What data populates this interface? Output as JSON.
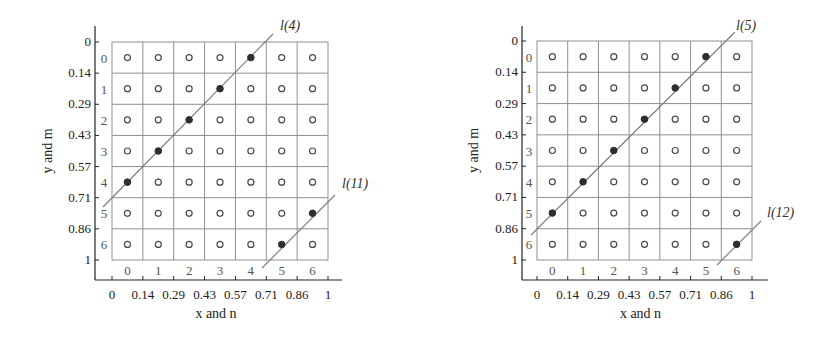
{
  "chart_data": [
    {
      "type": "scatter",
      "panel": "left",
      "xlabel": "x and n",
      "ylabel": "y and m",
      "x_ticks": [
        "0",
        "0.14",
        "0.29",
        "0.43",
        "0.57",
        "0.71",
        "0.86",
        "1"
      ],
      "y_ticks": [
        "0",
        "0.14",
        "0.29",
        "0.43",
        "0.57",
        "0.71",
        "0.86",
        "1"
      ],
      "column_indices": [
        "0",
        "1",
        "2",
        "3",
        "4",
        "5",
        "6"
      ],
      "row_indices": [
        "0",
        "1",
        "2",
        "3",
        "4",
        "5",
        "6"
      ],
      "grid_size": 7,
      "xlim": [
        0,
        1
      ],
      "ylim": [
        1,
        0
      ],
      "lines": [
        {
          "label": "l(4)",
          "filled_points": [
            [
              4,
              0
            ],
            [
              3,
              1
            ],
            [
              2,
              2
            ],
            [
              1,
              3
            ],
            [
              0,
              4
            ]
          ]
        },
        {
          "label": "l(11)",
          "filled_points": [
            [
              6,
              5
            ],
            [
              5,
              6
            ]
          ]
        }
      ],
      "note": "points given as [n, m]; all other grid cells hold open circles"
    },
    {
      "type": "scatter",
      "panel": "right",
      "xlabel": "x and n",
      "ylabel": "y and m",
      "x_ticks": [
        "0",
        "0.14",
        "0.29",
        "0.43",
        "0.57",
        "0.71",
        "0.86",
        "1"
      ],
      "y_ticks": [
        "0",
        "0.14",
        "0.29",
        "0.43",
        "0.57",
        "0.71",
        "0.86",
        "1"
      ],
      "column_indices": [
        "0",
        "1",
        "2",
        "3",
        "4",
        "5",
        "6"
      ],
      "row_indices": [
        "0",
        "1",
        "2",
        "3",
        "4",
        "5",
        "6"
      ],
      "grid_size": 7,
      "xlim": [
        0,
        1
      ],
      "ylim": [
        1,
        0
      ],
      "lines": [
        {
          "label": "l(5)",
          "filled_points": [
            [
              5,
              0
            ],
            [
              4,
              1
            ],
            [
              3,
              2
            ],
            [
              2,
              3
            ],
            [
              1,
              4
            ],
            [
              0,
              5
            ]
          ]
        },
        {
          "label": "l(12)",
          "filled_points": [
            [
              6,
              6
            ]
          ]
        }
      ],
      "note": "points given as [n, m]; all other grid cells hold open circles"
    }
  ],
  "panels": {
    "left": {
      "xlabel": "x and n",
      "ylabel": "y and m",
      "line_a_label": "l(4)",
      "line_b_label": "l(11)"
    },
    "right": {
      "xlabel": "x and n",
      "ylabel": "y and m",
      "line_a_label": "l(5)",
      "line_b_label": "l(12)"
    }
  },
  "colors": {
    "grid": "#8f8f8f",
    "axis": "#222222",
    "diagonal": "#7a7a7a",
    "filled_dot": "#2e2e2e",
    "open_dot_stroke": "#4a4a4a"
  }
}
